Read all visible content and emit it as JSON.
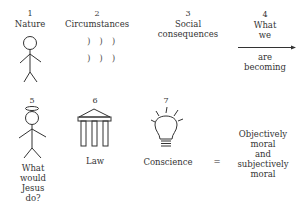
{
  "diagram": {
    "items": [
      {
        "number": "1",
        "label": "Nature",
        "icon": "stick-figure-icon"
      },
      {
        "number": "2",
        "label": "Circumstances",
        "icon": "parentheses-marks-icon",
        "marks": [
          ") ) )",
          ") ) )"
        ]
      },
      {
        "number": "3",
        "label_lines": [
          "Social",
          "consequences"
        ]
      },
      {
        "number": "4",
        "label_top": [
          "What",
          "we"
        ],
        "label_bottom": [
          "are",
          "becoming"
        ],
        "icon": "arrow-right-icon"
      },
      {
        "number": "5",
        "label_lines": [
          "What",
          "would",
          "Jesus",
          "do?"
        ],
        "icon": "haloed-stick-figure-icon"
      },
      {
        "number": "6",
        "label": "Law",
        "icon": "pillared-building-icon"
      },
      {
        "number": "7",
        "label": "Conscience",
        "icon": "light-bulb-icon"
      }
    ],
    "equals": "=",
    "result_lines": [
      "Objectively",
      "moral",
      "and",
      "subjectively",
      "moral"
    ]
  }
}
